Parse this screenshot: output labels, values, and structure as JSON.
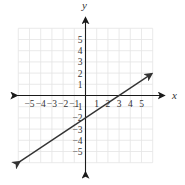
{
  "chart_data": {
    "type": "line",
    "title": "",
    "xlabel": "x",
    "ylabel": "y",
    "xlim": [
      -6,
      6
    ],
    "ylim": [
      -6,
      6
    ],
    "grid": true,
    "x_ticks": [
      "-5",
      "-4",
      "-3",
      "-2",
      "-1",
      "1",
      "2",
      "3",
      "4",
      "5"
    ],
    "y_ticks": [
      "5",
      "4",
      "3",
      "2",
      "1",
      "-1",
      "-2",
      "-3",
      "-4",
      "-5"
    ],
    "series": [
      {
        "name": "line",
        "equation": "y = (2/3)x - 2",
        "x": [
          -5.9,
          0,
          3,
          5.9
        ],
        "y": [
          -5.93,
          -2,
          0,
          1.93
        ],
        "arrows": "both"
      }
    ]
  },
  "colors": {
    "grid": "#e4e4e4",
    "axis": "#1a1a1a",
    "line": "#333333",
    "text": "#333333"
  }
}
